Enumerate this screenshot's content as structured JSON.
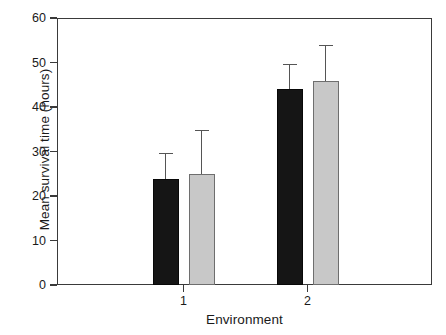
{
  "chart_data": {
    "type": "bar",
    "title": "",
    "xlabel": "Environment",
    "ylabel": "Mean survival time (hours)",
    "categories": [
      "1",
      "2"
    ],
    "xtick_labels": [
      "1",
      "2"
    ],
    "ytick_labels": [
      "0",
      "10",
      "20",
      "30",
      "40",
      "50",
      "60"
    ],
    "ytick_values": [
      0,
      10,
      20,
      30,
      40,
      50,
      60
    ],
    "ylim": [
      0,
      60
    ],
    "grid": false,
    "legend": "none",
    "error_bars": "upper-only",
    "series": [
      {
        "name": "dark",
        "color": "#151515",
        "values": [
          23.8,
          44.0
        ],
        "errors_upper": [
          5.9,
          5.7
        ]
      },
      {
        "name": "light",
        "color": "#c8c8c8",
        "values": [
          25.0,
          45.8
        ],
        "errors_upper": [
          9.8,
          8.2
        ]
      }
    ]
  },
  "axes": {
    "y_title": "Mean survival time (hours)",
    "x_title": "Environment"
  }
}
